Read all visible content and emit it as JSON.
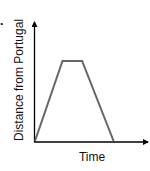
{
  "option_marker": ".",
  "chart_data": {
    "type": "line",
    "title": "",
    "xlabel": "Time",
    "ylabel": "Distance from Portugal",
    "x": [
      0,
      3.5,
      6,
      10
    ],
    "values": [
      0,
      10,
      10,
      0
    ],
    "grid": false,
    "legend": null,
    "line_color": "#666666",
    "axis_color": "#000000"
  }
}
